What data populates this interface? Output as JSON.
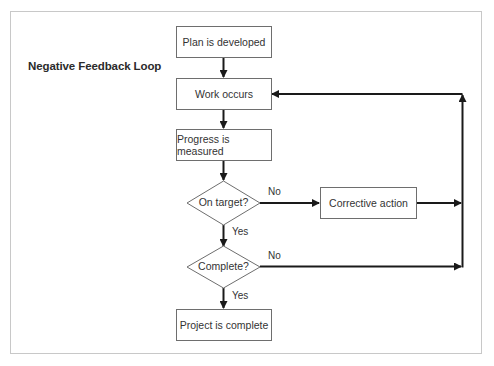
{
  "title": "Negative Feedback Loop",
  "nodes": {
    "plan": "Plan is developed",
    "work": "Work occurs",
    "progress": "Progress is measured",
    "on_target": "On target?",
    "corrective": "Corrective action",
    "complete_q": "Complete?",
    "project_complete": "Project is complete"
  },
  "edges": {
    "on_target_no": "No",
    "on_target_yes": "Yes",
    "complete_no": "No",
    "complete_yes": "Yes"
  },
  "colors": {
    "line": "#1a1a1a",
    "box_border": "#6e6e6e",
    "frame": "#c8c8c8"
  }
}
